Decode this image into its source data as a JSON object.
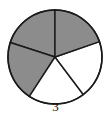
{
  "figure": {
    "caption": "3",
    "kind": "pie-diagram"
  },
  "chart_data": {
    "type": "pie",
    "title": "",
    "subtitle": "",
    "xlabel": "",
    "ylabel": "",
    "caption": "3",
    "legend": [],
    "grid": false,
    "total_slices": 5,
    "shaded_slices": 3,
    "unshaded_slices": 2,
    "fraction_shaded": "3/5",
    "categories": [
      "slice-1",
      "slice-2",
      "slice-3",
      "slice-4",
      "slice-5"
    ],
    "values": [
      72,
      75,
      70,
      72,
      71
    ],
    "units": "degrees",
    "slices": [
      {
        "name": "slice-1",
        "start_angle": 90,
        "end_angle": 162,
        "sweep": 72,
        "fill": "shaded",
        "color": "#8c8c8c"
      },
      {
        "name": "slice-2",
        "start_angle": 162,
        "end_angle": 237,
        "sweep": 75,
        "fill": "shaded",
        "color": "#8c8c8c"
      },
      {
        "name": "slice-3",
        "start_angle": 237,
        "end_angle": 307,
        "sweep": 70,
        "fill": "unshaded",
        "color": "#ffffff"
      },
      {
        "name": "slice-4",
        "start_angle": 307,
        "end_angle": 19,
        "sweep": 72,
        "fill": "unshaded",
        "color": "#ffffff"
      },
      {
        "name": "slice-5",
        "start_angle": 19,
        "end_angle": 90,
        "sweep": 71,
        "fill": "shaded",
        "color": "#8c8c8c"
      }
    ],
    "geometry": {
      "center_x": 55,
      "center_y": 57,
      "radius": 47
    },
    "colors": {
      "shaded": "#8c8c8c",
      "unshaded": "#ffffff",
      "outline": "#1a1a1a",
      "background": "#ffffff",
      "caption": "#101010"
    }
  }
}
